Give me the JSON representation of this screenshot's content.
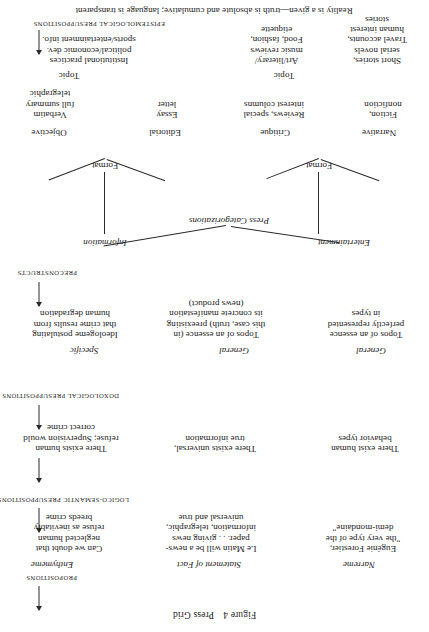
{
  "figure": {
    "number": "Figure 4",
    "title": "Press Grid"
  },
  "axis_labels": {
    "epistemological": "EPISTEMOLOGICAL PRESUPPOSITIONS",
    "preconstructs": "PRECONSTRUCTS",
    "doxological": "DOXOLOGICAL PRESUPPOSITIONS",
    "logico_semantic": "LOGICO-SEMANTIC PRESUPPOSITIONS",
    "propositions": "PROPOSITIONS"
  },
  "epistemological_statement": "Reality is a given—truth is absolute and cumulative; language is transparent",
  "press_categorizations": {
    "root": "Press Categorizations",
    "branches": [
      "Information",
      "Entertainment"
    ]
  },
  "format": {
    "information_label": "Format",
    "entertainment_label": "Format"
  },
  "formats": {
    "objective": "Objective",
    "editorial": "Editorial",
    "critique": "Critique",
    "narrative": "Narrative"
  },
  "format_details": {
    "objective": "Verbatim\nfull summary\ntelegraphic",
    "editorial": "Essay\nletter",
    "critique": "Reviews, special\ninterest columns",
    "narrative": "Fiction,\nnonfiction"
  },
  "topic": {
    "information_label": "Topic",
    "entertainment_label": "Topic"
  },
  "topics": {
    "information": "Institutional practices\npolitical/economic dev.\nsports/entertainment info.",
    "critique": "Art/literary/\nmusic reviews\nFood, fashion,\netiquette",
    "narrative": "Short stories,\nserial novels\nTravel accounts,\nhuman interest\nstories"
  },
  "doxological": {
    "columns": [
      {
        "qualifier": "Specific",
        "text": "Ideologeme postulating\nthat crime results from\nhuman degradation"
      },
      {
        "qualifier": "General",
        "text": "Topos of an essence (in\nthis case, truth) preexisting\nits concrete manifestation\n(news product)"
      },
      {
        "qualifier": "General",
        "text": "Topos of an essence\nperfectly represented\nin types"
      }
    ]
  },
  "logico_semantic": {
    "columns": [
      "There exists human\nrefuse; Supervision would\ncorrect crime",
      "There exists universal,\ntrue information",
      "There exist human\nbehavior types"
    ]
  },
  "propositions": {
    "columns": [
      {
        "kind": "Enthymeme",
        "text": "Can we doubt that\nneglected human\nrefuse as inevitably\nbreeds crime"
      },
      {
        "kind": "Statement of Fact",
        "text": "Le Matin will be a news-\npaper. . . giving news\ninformation, telegraphic,\nuniversal and true"
      },
      {
        "kind": "Narreme",
        "text": "Eugénie Forestier,\n\"the very type of the\ndemi-mondaine\""
      }
    ]
  }
}
